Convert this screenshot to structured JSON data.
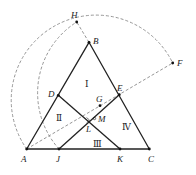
{
  "diagram": {
    "points": {
      "A": {
        "label": "A",
        "x": 26.7,
        "y": 149
      },
      "B": {
        "label": "B",
        "x": 89,
        "y": 42.3
      },
      "C": {
        "label": "C",
        "x": 149.3,
        "y": 149
      },
      "D": {
        "label": "D",
        "x": 58.3,
        "y": 95.3
      },
      "E": {
        "label": "E",
        "x": 119.3,
        "y": 94.7
      },
      "F": {
        "label": "F",
        "x": 172.7,
        "y": 63
      },
      "G": {
        "label": "G",
        "x": 100,
        "y": 105.7
      },
      "H": {
        "label": "H",
        "x": 76.7,
        "y": 22
      },
      "J": {
        "label": "J",
        "x": 59,
        "y": 149
      },
      "K": {
        "label": "K",
        "x": 120,
        "y": 149
      },
      "L": {
        "label": "L"
      },
      "M": {
        "label": "M",
        "x": 94.3,
        "y": 119
      }
    },
    "regions": {
      "r1": "Ⅰ",
      "r2": "Ⅱ",
      "r3": "Ⅲ",
      "r4": "Ⅳ"
    },
    "colors": {
      "solid": "#222222",
      "dashed": "#888888"
    }
  }
}
